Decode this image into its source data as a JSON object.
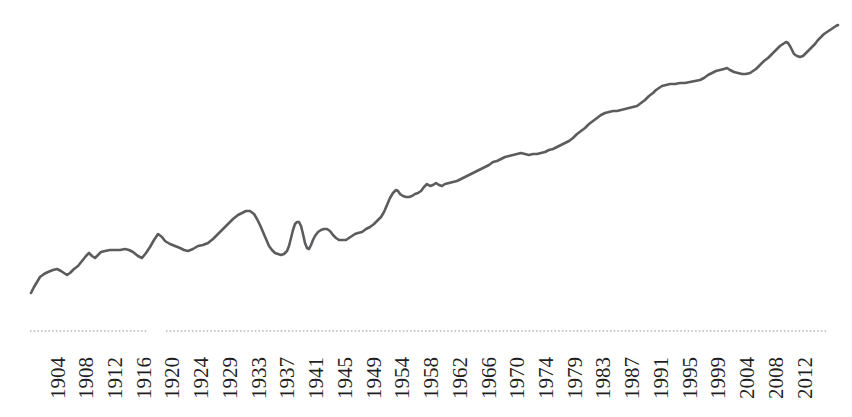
{
  "chart_data": {
    "type": "line",
    "title": "",
    "canvas": {
      "width": 852,
      "height": 417,
      "background": "#ffffff"
    },
    "x_axis": {
      "labels": [
        "1904",
        "1908",
        "1912",
        "1916",
        "1920",
        "1924",
        "1929",
        "1933",
        "1937",
        "1941",
        "1945",
        "1949",
        "1954",
        "1958",
        "1962",
        "1966",
        "1970",
        "1974",
        "1979",
        "1983",
        "1987",
        "1991",
        "1995",
        "1999",
        "2004",
        "2008",
        "2012"
      ],
      "label_start_x": 57,
      "label_spacing": 28.73,
      "label_baseline_y": 399,
      "label_font_size": 21,
      "label_color": "#1f1f1f",
      "axis_line_y": 331,
      "axis_line_color": "#b4b4b4",
      "axis_line_style": "dotted",
      "axis_segments_x": [
        [
          30,
          147
        ],
        [
          166,
          827
        ]
      ]
    },
    "y_axis": {
      "visible": false,
      "labels": []
    },
    "legend": {
      "visible": false
    },
    "grid": false,
    "series": [
      {
        "name": "value-line",
        "color": "#5c5c5f",
        "stroke_width": 2.6,
        "points_px": [
          [
            31,
            293
          ],
          [
            34,
            287
          ],
          [
            37,
            282
          ],
          [
            40,
            277
          ],
          [
            44,
            274
          ],
          [
            48,
            272
          ],
          [
            53,
            270
          ],
          [
            57,
            269
          ],
          [
            61,
            271
          ],
          [
            64,
            273
          ],
          [
            67,
            275
          ],
          [
            70,
            273
          ],
          [
            74,
            269
          ],
          [
            78,
            266
          ],
          [
            82,
            261
          ],
          [
            86,
            256
          ],
          [
            89,
            253
          ],
          [
            92,
            256
          ],
          [
            95,
            258
          ],
          [
            98,
            255
          ],
          [
            101,
            252
          ],
          [
            105,
            251
          ],
          [
            110,
            250
          ],
          [
            115,
            250
          ],
          [
            120,
            250
          ],
          [
            125,
            249
          ],
          [
            129,
            250
          ],
          [
            133,
            252
          ],
          [
            138,
            256
          ],
          [
            142,
            258
          ],
          [
            146,
            253
          ],
          [
            150,
            247
          ],
          [
            154,
            240
          ],
          [
            158,
            234
          ],
          [
            162,
            237
          ],
          [
            165,
            241
          ],
          [
            170,
            244
          ],
          [
            175,
            246
          ],
          [
            180,
            248
          ],
          [
            184,
            250
          ],
          [
            188,
            251
          ],
          [
            193,
            249
          ],
          [
            198,
            246
          ],
          [
            203,
            245
          ],
          [
            208,
            243
          ],
          [
            213,
            239
          ],
          [
            218,
            234
          ],
          [
            223,
            229
          ],
          [
            228,
            224
          ],
          [
            233,
            219
          ],
          [
            238,
            215
          ],
          [
            242,
            213
          ],
          [
            246,
            211
          ],
          [
            250,
            211
          ],
          [
            254,
            214
          ],
          [
            257,
            219
          ],
          [
            260,
            225
          ],
          [
            263,
            232
          ],
          [
            266,
            239
          ],
          [
            269,
            246
          ],
          [
            272,
            250
          ],
          [
            275,
            253
          ],
          [
            278,
            254
          ],
          [
            281,
            255
          ],
          [
            284,
            254
          ],
          [
            287,
            251
          ],
          [
            289,
            246
          ],
          [
            291,
            238
          ],
          [
            293,
            230
          ],
          [
            295,
            224
          ],
          [
            297,
            222
          ],
          [
            299,
            222
          ],
          [
            301,
            226
          ],
          [
            303,
            234
          ],
          [
            305,
            243
          ],
          [
            307,
            248
          ],
          [
            309,
            249
          ],
          [
            311,
            245
          ],
          [
            313,
            240
          ],
          [
            315,
            236
          ],
          [
            318,
            232
          ],
          [
            321,
            230
          ],
          [
            324,
            229
          ],
          [
            327,
            229
          ],
          [
            330,
            231
          ],
          [
            333,
            235
          ],
          [
            336,
            238
          ],
          [
            339,
            240
          ],
          [
            343,
            240
          ],
          [
            346,
            240
          ],
          [
            349,
            238
          ],
          [
            352,
            236
          ],
          [
            355,
            234
          ],
          [
            358,
            233
          ],
          [
            362,
            232
          ],
          [
            366,
            229
          ],
          [
            370,
            227
          ],
          [
            374,
            224
          ],
          [
            378,
            220
          ],
          [
            381,
            217
          ],
          [
            384,
            212
          ],
          [
            387,
            205
          ],
          [
            390,
            198
          ],
          [
            393,
            193
          ],
          [
            396,
            190
          ],
          [
            398,
            191
          ],
          [
            400,
            194
          ],
          [
            403,
            196
          ],
          [
            406,
            197
          ],
          [
            409,
            197
          ],
          [
            412,
            196
          ],
          [
            415,
            194
          ],
          [
            418,
            193
          ],
          [
            421,
            191
          ],
          [
            424,
            187
          ],
          [
            427,
            184
          ],
          [
            430,
            186
          ],
          [
            433,
            185
          ],
          [
            436,
            183
          ],
          [
            439,
            185
          ],
          [
            442,
            186
          ],
          [
            445,
            184
          ],
          [
            449,
            183
          ],
          [
            453,
            182
          ],
          [
            457,
            181
          ],
          [
            461,
            179
          ],
          [
            465,
            177
          ],
          [
            469,
            175
          ],
          [
            473,
            173
          ],
          [
            477,
            171
          ],
          [
            481,
            169
          ],
          [
            485,
            167
          ],
          [
            489,
            165
          ],
          [
            493,
            162
          ],
          [
            497,
            161
          ],
          [
            501,
            159
          ],
          [
            505,
            157
          ],
          [
            509,
            156
          ],
          [
            513,
            155
          ],
          [
            517,
            154
          ],
          [
            521,
            153
          ],
          [
            525,
            154
          ],
          [
            529,
            155
          ],
          [
            533,
            154
          ],
          [
            537,
            154
          ],
          [
            541,
            153
          ],
          [
            545,
            152
          ],
          [
            549,
            150
          ],
          [
            553,
            149
          ],
          [
            557,
            147
          ],
          [
            561,
            145
          ],
          [
            565,
            143
          ],
          [
            569,
            141
          ],
          [
            573,
            138
          ],
          [
            577,
            134
          ],
          [
            581,
            131
          ],
          [
            585,
            128
          ],
          [
            589,
            124
          ],
          [
            593,
            121
          ],
          [
            597,
            118
          ],
          [
            601,
            115
          ],
          [
            605,
            113
          ],
          [
            609,
            112
          ],
          [
            613,
            111
          ],
          [
            617,
            111
          ],
          [
            621,
            110
          ],
          [
            625,
            109
          ],
          [
            629,
            108
          ],
          [
            633,
            107
          ],
          [
            637,
            106
          ],
          [
            641,
            103
          ],
          [
            645,
            100
          ],
          [
            649,
            96
          ],
          [
            653,
            93
          ],
          [
            656,
            90
          ],
          [
            659,
            88
          ],
          [
            662,
            86
          ],
          [
            666,
            85
          ],
          [
            670,
            84
          ],
          [
            675,
            84
          ],
          [
            680,
            83
          ],
          [
            685,
            83
          ],
          [
            690,
            82
          ],
          [
            695,
            81
          ],
          [
            700,
            80
          ],
          [
            704,
            78
          ],
          [
            708,
            75
          ],
          [
            712,
            73
          ],
          [
            716,
            71
          ],
          [
            720,
            70
          ],
          [
            724,
            69
          ],
          [
            727,
            68
          ],
          [
            730,
            70
          ],
          [
            734,
            72
          ],
          [
            738,
            73
          ],
          [
            742,
            74
          ],
          [
            746,
            74
          ],
          [
            750,
            73
          ],
          [
            753,
            71
          ],
          [
            756,
            69
          ],
          [
            760,
            65
          ],
          [
            764,
            61
          ],
          [
            768,
            58
          ],
          [
            771,
            55
          ],
          [
            774,
            52
          ],
          [
            777,
            49
          ],
          [
            780,
            46
          ],
          [
            783,
            44
          ],
          [
            786,
            42
          ],
          [
            788,
            43
          ],
          [
            790,
            46
          ],
          [
            792,
            50
          ],
          [
            794,
            54
          ],
          [
            797,
            56
          ],
          [
            800,
            57
          ],
          [
            803,
            56
          ],
          [
            806,
            53
          ],
          [
            809,
            50
          ],
          [
            812,
            47
          ],
          [
            815,
            44
          ],
          [
            818,
            40
          ],
          [
            821,
            37
          ],
          [
            824,
            34
          ],
          [
            827,
            32
          ],
          [
            830,
            30
          ],
          [
            833,
            28
          ],
          [
            836,
            26
          ],
          [
            838,
            25
          ]
        ]
      }
    ]
  }
}
